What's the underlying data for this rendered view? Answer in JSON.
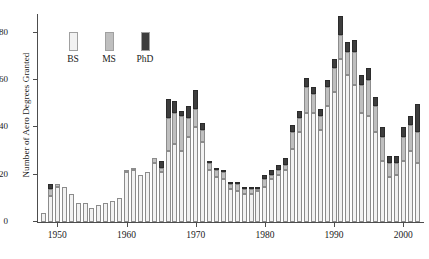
{
  "chart_data": {
    "type": "bar",
    "title": "",
    "subtitle": "",
    "xlabel": "",
    "ylabel": "Number of Aero Degrees Granted",
    "stacked": true,
    "grid": false,
    "legend_position": "top-left",
    "ylim": [
      0,
      88
    ],
    "yticks": [
      0,
      20,
      40,
      60,
      80
    ],
    "xticks": [
      1950,
      1960,
      1970,
      1980,
      1990,
      2000
    ],
    "xlim": [
      1947.2,
      2003.0
    ],
    "legend": [
      "BS",
      "MS",
      "PhD"
    ],
    "colors": {
      "BS": "#f2f2f2",
      "MS": "#bfbfbf",
      "PhD": "#3d3d3d",
      "axis": "#4d4d4d"
    },
    "categories": [
      1948,
      1949,
      1950,
      1951,
      1952,
      1953,
      1954,
      1955,
      1956,
      1957,
      1958,
      1959,
      1960,
      1961,
      1962,
      1963,
      1964,
      1965,
      1966,
      1967,
      1968,
      1969,
      1970,
      1971,
      1972,
      1973,
      1974,
      1975,
      1976,
      1977,
      1978,
      1979,
      1980,
      1981,
      1982,
      1983,
      1984,
      1985,
      1986,
      1987,
      1988,
      1989,
      1990,
      1991,
      1992,
      1993,
      1994,
      1995,
      1996,
      1997,
      1998,
      1999,
      2000,
      2001,
      2002
    ],
    "series": [
      {
        "name": "BS",
        "values": [
          4,
          11,
          15,
          15,
          12,
          8,
          8,
          6,
          7,
          8,
          9,
          10,
          21,
          22,
          20,
          21,
          25,
          21,
          30,
          33,
          30,
          36,
          40,
          34,
          22,
          19,
          18,
          14,
          13,
          12,
          12,
          13,
          15,
          18,
          20,
          22,
          31,
          38,
          46,
          46,
          39,
          49,
          55,
          69,
          62,
          58,
          46,
          45,
          38,
          26,
          19,
          20,
          26,
          30,
          25
        ]
      },
      {
        "name": "MS",
        "values": [
          0,
          3,
          1,
          0,
          0,
          0,
          0,
          0,
          0,
          0,
          0,
          0,
          1,
          1,
          0,
          0,
          2,
          2,
          14,
          13,
          15,
          8,
          8,
          5,
          3,
          3,
          3,
          2,
          3,
          2,
          2,
          1,
          3,
          2,
          2,
          2,
          7,
          6,
          11,
          8,
          6,
          8,
          10,
          10,
          10,
          14,
          12,
          15,
          11,
          10,
          6,
          5,
          10,
          11,
          13
        ]
      },
      {
        "name": "PhD",
        "values": [
          0,
          2,
          0,
          0,
          0,
          0,
          0,
          0,
          0,
          0,
          0,
          0,
          0,
          0,
          0,
          0,
          0,
          3,
          8,
          5,
          2,
          5,
          8,
          3,
          1,
          1,
          1,
          1,
          1,
          1,
          1,
          1,
          2,
          2,
          2,
          3,
          3,
          3,
          4,
          3,
          3,
          3,
          4,
          8,
          4,
          5,
          4,
          5,
          4,
          4,
          3,
          3,
          4,
          4,
          12
        ]
      }
    ]
  }
}
